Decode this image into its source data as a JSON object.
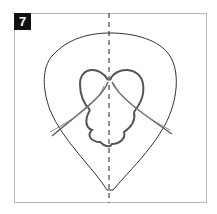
{
  "diagram": {
    "step_number": "7",
    "colors": {
      "badge_bg": "#111111",
      "badge_text": "#ffffff",
      "frame_border": "#b8b8b8",
      "outline": "#333333",
      "cord": "#555555",
      "center_line": "#222222"
    }
  }
}
